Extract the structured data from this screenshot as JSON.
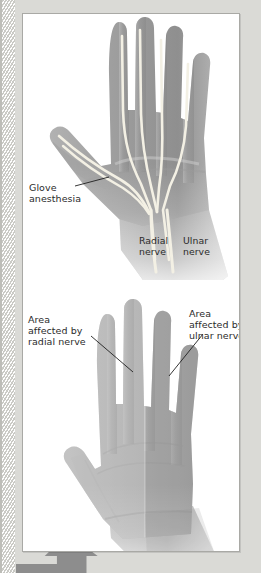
{
  "figure": {
    "background_color": "#d9d9d5",
    "panel_color": "#ffffff",
    "panel_border_color": "#a9a9a5",
    "text_color": "#2b2b2b",
    "arrow_color": "#8d8d8d",
    "hatch_light": "#ffffff",
    "hatch_dark": "#c9c9c4"
  },
  "upper_figure": {
    "name": "dorsal-hand-glove-anesthesia",
    "description": "Grayscale dorsal view of a left hand and forearm with pale nerve branches fanning from the wrist into the fingers and thumb",
    "skin_light": "#c9c9c9",
    "skin_mid": "#a8a8a8",
    "skin_dark": "#8a8a8a",
    "nerve_color": "#f2efe2",
    "labels": {
      "glove_anesthesia": {
        "lines": [
          "Glove",
          "anesthesia"
        ],
        "text": "Glove anesthesia"
      },
      "radial_nerve": {
        "lines": [
          "Radial",
          "nerve"
        ],
        "text": "Radial nerve"
      },
      "ulnar_nerve": {
        "lines": [
          "Ulnar",
          "nerve"
        ],
        "text": "Ulnar nerve"
      }
    }
  },
  "lower_figure": {
    "name": "palmar-hand-nerve-areas",
    "description": "Grayscale palmar view of a left hand and forearm shaded into radial and ulnar nerve territories",
    "skin_light": "#cccccc",
    "skin_mid": "#ababab",
    "skin_dark": "#8f8f8f",
    "radial_zone_tint": "#bdbdbd",
    "ulnar_zone_tint": "#a4a4a4",
    "labels": {
      "area_radial": {
        "lines": [
          "Area",
          "affected by",
          "radial nerve"
        ],
        "text": "Area affected by radial nerve"
      },
      "area_ulnar": {
        "lines": [
          "Area",
          "affected by",
          "ulnar nerve"
        ],
        "text": "Area affected by ulnar nerve"
      }
    }
  },
  "page_arrow": {
    "name": "page-turn-arrow",
    "direction": "up-left",
    "color": "#8d8d8d"
  }
}
